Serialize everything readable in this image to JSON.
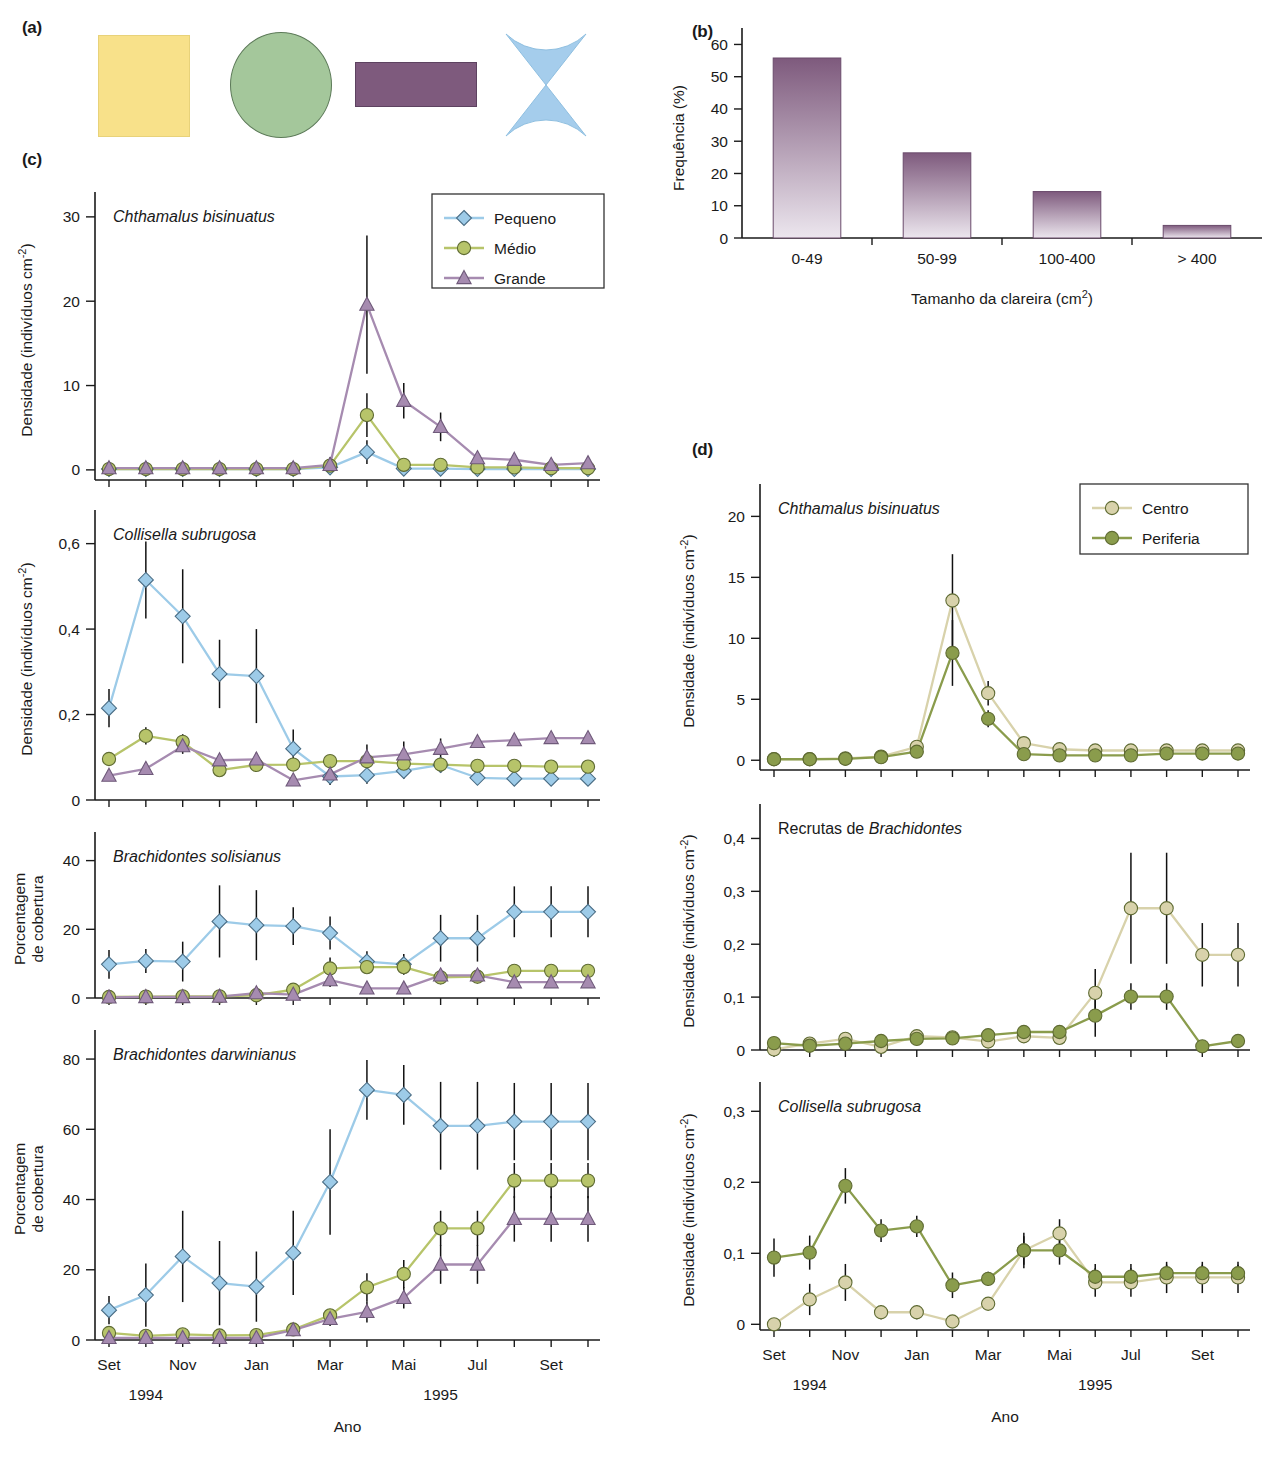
{
  "figure": {
    "panel_labels": {
      "a": "(a)",
      "b": "(b)",
      "c": "(c)",
      "d": "(d)"
    },
    "colors": {
      "pequeno": "#9dcbe8",
      "medio": "#b7c46a",
      "grande": "#a68bb0",
      "centro": "#d8d2ab",
      "periferia": "#7f9440",
      "bar_top": "#7e5a7d",
      "bar_bottom": "#ece6ee",
      "shape_yellow": "#f8e18a",
      "shape_green": "#a4c79b",
      "shape_purple": "#7e5a7d",
      "shape_blue": "#a5cdec"
    }
  },
  "panel_a": {
    "shapes": [
      {
        "name": "square",
        "color": "#f8e18a"
      },
      {
        "name": "circle",
        "color": "#a4c79b"
      },
      {
        "name": "rectangle",
        "color": "#7e5a7d"
      },
      {
        "name": "bowtie",
        "color": "#a5cdec"
      }
    ]
  },
  "chart_data": [
    {
      "id": "panel_b",
      "type": "bar",
      "title": "",
      "xlabel": "Tamanho da clareira (cm2)",
      "xlabel_sup": "2",
      "xlabel_base": "Tamanho da clareira (cm",
      "ylabel": "Frequência (%)",
      "categories": [
        "0-49",
        "50-99",
        "100-400",
        "> 400"
      ],
      "values": [
        55.8,
        26.4,
        14.4,
        3.9
      ],
      "yticks": [
        0,
        10,
        20,
        30,
        40,
        50,
        60
      ],
      "ylim": [
        0,
        62
      ],
      "grid": false
    },
    {
      "id": "panel_c_1",
      "type": "line",
      "title": "Chthamalus bisinuatus",
      "title_italic": true,
      "ylabel": "Densidade (indivíduos cm",
      "ylabel_sup": "-2",
      "ylabel_tail": ")",
      "yticks": [
        0,
        10,
        20,
        30
      ],
      "ylim": [
        -1.2,
        32
      ],
      "x": [
        "Set",
        "",
        "Nov",
        "",
        "Jan",
        "",
        "Mar",
        "",
        "Mai",
        "",
        "Jul",
        "",
        "Set",
        ""
      ],
      "legend": {
        "position": "top-right",
        "entries": [
          "Pequeno",
          "Médio",
          "Grande"
        ]
      },
      "series": [
        {
          "name": "Pequeno",
          "marker": "diamond",
          "color": "#9dcbe8",
          "values": [
            0.1,
            0.1,
            0.1,
            0.1,
            0.1,
            0.1,
            0.3,
            2.1,
            0.15,
            0.15,
            0.1,
            0.1,
            0.1,
            0.1
          ],
          "err": [
            0,
            0,
            0,
            0,
            0,
            0,
            0,
            1.4,
            0,
            0,
            0,
            0,
            0,
            0
          ]
        },
        {
          "name": "Médio",
          "marker": "circle",
          "color": "#b7c46a",
          "values": [
            0.1,
            0.1,
            0.1,
            0.1,
            0.1,
            0.1,
            0.5,
            6.5,
            0.6,
            0.6,
            0.3,
            0.3,
            0.2,
            0.2
          ],
          "err": [
            0,
            0,
            0,
            0,
            0,
            0,
            0,
            2.6,
            0.3,
            0.3,
            0,
            0,
            0,
            0
          ]
        },
        {
          "name": "Grande",
          "marker": "triangle",
          "color": "#a68bb0",
          "values": [
            0.2,
            0.2,
            0.2,
            0.2,
            0.2,
            0.2,
            0.6,
            19.6,
            8.2,
            5.1,
            1.4,
            1.2,
            0.6,
            0.8
          ],
          "err": [
            0,
            0,
            0,
            0,
            0,
            0,
            0.9,
            8.2,
            2.1,
            1.7,
            0,
            0,
            0,
            0.8
          ]
        }
      ]
    },
    {
      "id": "panel_c_2",
      "type": "line",
      "title": "Collisella subrugosa",
      "title_italic": true,
      "ylabel": "Densidade (indivíduos cm",
      "ylabel_sup": "-2",
      "ylabel_tail": ")",
      "yticks": [
        0,
        0.2,
        0.4,
        0.6
      ],
      "ytick_labels": [
        "0",
        "0,2",
        "0,4",
        "0,6"
      ],
      "ylim": [
        0,
        0.66
      ],
      "x": [
        "Set",
        "",
        "Nov",
        "",
        "Jan",
        "",
        "Mar",
        "",
        "Mai",
        "",
        "Jul",
        "",
        "Set",
        ""
      ],
      "series": [
        {
          "name": "Pequeno",
          "marker": "diamond",
          "color": "#9dcbe8",
          "values": [
            0.215,
            0.515,
            0.43,
            0.295,
            0.29,
            0.12,
            0.055,
            0.058,
            0.068,
            0.082,
            0.052,
            0.05,
            0.05,
            0.05
          ],
          "err": [
            0.045,
            0.09,
            0.11,
            0.08,
            0.11,
            0.045,
            0.02,
            0.02,
            0.018,
            0.018,
            0,
            0,
            0,
            0
          ]
        },
        {
          "name": "Médio",
          "marker": "circle",
          "color": "#b7c46a",
          "values": [
            0.096,
            0.15,
            0.136,
            0.07,
            0.082,
            0.083,
            0.091,
            0.091,
            0.085,
            0.083,
            0.08,
            0.08,
            0.078,
            0.078
          ],
          "err": [
            0,
            0.02,
            0.018,
            0.012,
            0.012,
            0.012,
            0.01,
            0.01,
            0.01,
            0.01,
            0,
            0,
            0,
            0
          ]
        },
        {
          "name": "Grande",
          "marker": "triangle",
          "color": "#a68bb0",
          "values": [
            0.057,
            0.073,
            0.126,
            0.093,
            0.095,
            0.046,
            0.06,
            0.1,
            0.107,
            0.12,
            0.136,
            0.14,
            0.145,
            0.145
          ],
          "err": [
            0,
            0,
            0.018,
            0.012,
            0.016,
            0.012,
            0.012,
            0.03,
            0.03,
            0.024,
            0.012,
            0,
            0.012,
            0.012
          ]
        }
      ]
    },
    {
      "id": "panel_c_3",
      "type": "line",
      "title": "Brachidontes solisianus",
      "title_italic": true,
      "ylabel": "Porcentagem de cobertura",
      "ylabel_line1": "Porcentagem",
      "ylabel_line2": "de cobertura",
      "yticks": [
        0,
        20,
        40
      ],
      "ylim": [
        0,
        46
      ],
      "x": [
        "Set",
        "",
        "Nov",
        "",
        "Jan",
        "",
        "Mar",
        "",
        "Mai",
        "",
        "Jul",
        "",
        "Set",
        ""
      ],
      "series": [
        {
          "name": "Pequeno",
          "marker": "diamond",
          "color": "#9dcbe8",
          "values": [
            9.8,
            10.8,
            10.6,
            22.3,
            21.2,
            20.9,
            18.9,
            10.6,
            9.8,
            17.4,
            17.4,
            25.1,
            25.1,
            25.1
          ],
          "err": [
            4.2,
            3.5,
            5.8,
            10.5,
            10.2,
            5.5,
            4.8,
            3.0,
            3.0,
            6.8,
            6.8,
            7.4,
            7.4,
            7.4
          ]
        },
        {
          "name": "Médio",
          "marker": "circle",
          "color": "#b7c46a",
          "values": [
            0.3,
            0.4,
            0.5,
            0.5,
            0.8,
            2.4,
            8.6,
            9.0,
            9.0,
            6.0,
            6.2,
            7.9,
            7.9,
            7.9
          ],
          "err": [
            0,
            0,
            0,
            0,
            0.6,
            1.2,
            3.2,
            1.2,
            1.2,
            2.0,
            2.0,
            0,
            0,
            0
          ]
        },
        {
          "name": "Grande",
          "marker": "triangle",
          "color": "#a68bb0",
          "values": [
            0.2,
            0.3,
            0.3,
            0.4,
            1.4,
            1.0,
            5.2,
            2.8,
            2.8,
            6.6,
            6.6,
            4.6,
            4.6,
            4.6
          ],
          "err": [
            0,
            0,
            0,
            0,
            0.8,
            0.8,
            2.0,
            0,
            0,
            0,
            0,
            0,
            0,
            0
          ]
        }
      ]
    },
    {
      "id": "panel_c_4",
      "type": "line",
      "title": "Brachidontes darwinianus",
      "title_italic": true,
      "ylabel": "Porcentagem de cobertura",
      "ylabel_line1": "Porcentagem",
      "ylabel_line2": "de cobertura",
      "yticks": [
        0,
        20,
        40,
        60,
        80
      ],
      "ylim": [
        0,
        86
      ],
      "x": [
        "Set",
        "",
        "Nov",
        "",
        "Jan",
        "",
        "Mar",
        "",
        "Mai",
        "",
        "Jul",
        "",
        "Set",
        ""
      ],
      "series": [
        {
          "name": "Pequeno",
          "marker": "diamond",
          "color": "#9dcbe8",
          "values": [
            8.5,
            12.8,
            23.8,
            16.2,
            15.2,
            24.8,
            45.0,
            71.2,
            69.8,
            61.0,
            61.0,
            62.2,
            62.2,
            62.2
          ],
          "err": [
            4.0,
            9.0,
            13.0,
            12.0,
            10.0,
            12.0,
            15.0,
            8.5,
            8.5,
            12.5,
            12.5,
            11.0,
            11.0,
            11.0
          ]
        },
        {
          "name": "Médio",
          "marker": "circle",
          "color": "#b7c46a",
          "values": [
            2.0,
            1.2,
            1.6,
            1.3,
            1.4,
            3.0,
            7.0,
            15.0,
            18.8,
            31.8,
            31.8,
            45.4,
            45.4,
            45.4
          ],
          "err": [
            0,
            0,
            0,
            0,
            0,
            0,
            0,
            4.0,
            4.0,
            5.0,
            5.0,
            5.0,
            5.0,
            5.0
          ]
        },
        {
          "name": "Grande",
          "marker": "triangle",
          "color": "#a68bb0",
          "values": [
            0.6,
            0.6,
            0.6,
            0.6,
            0.6,
            2.8,
            6.0,
            8.0,
            12.0,
            21.5,
            21.5,
            34.5,
            34.5,
            34.5
          ],
          "err": [
            0,
            0,
            0,
            0,
            0,
            0,
            2.0,
            3.0,
            3.0,
            5.5,
            5.5,
            6.5,
            6.5,
            6.5
          ]
        }
      ],
      "xlabel_months": [
        "Set",
        "Nov",
        "Jan",
        "Mar",
        "Mai",
        "Jul",
        "Set"
      ],
      "xlabel_years": [
        "1994",
        "1995"
      ],
      "xlabel": "Ano"
    },
    {
      "id": "panel_d_1",
      "type": "line",
      "title": "Chthamalus bisinuatus",
      "title_italic": true,
      "ylabel": "Densidade (indivíduos cm",
      "ylabel_sup": "-2",
      "ylabel_tail": ")",
      "yticks": [
        0,
        5,
        10,
        15,
        20
      ],
      "ylim": [
        -0.8,
        22
      ],
      "x": [
        "Set",
        "",
        "Nov",
        "",
        "Jan",
        "",
        "Mar",
        "",
        "Mai",
        "",
        "Jul",
        "",
        "Set",
        ""
      ],
      "legend": {
        "position": "top-right",
        "entries": [
          "Centro",
          "Periferia"
        ]
      },
      "series": [
        {
          "name": "Centro",
          "marker": "circle",
          "color": "#d8d2ab",
          "values": [
            0.1,
            0.1,
            0.15,
            0.3,
            1.1,
            13.1,
            5.5,
            1.4,
            0.9,
            0.8,
            0.8,
            0.8,
            0.8,
            0.8
          ],
          "err": [
            0,
            0,
            0,
            0,
            0,
            3.8,
            1.0,
            0,
            0,
            0,
            0,
            0,
            0,
            0
          ]
        },
        {
          "name": "Periferia",
          "marker": "circle",
          "color": "#8a9c4c",
          "values": [
            0.08,
            0.08,
            0.12,
            0.25,
            0.7,
            8.8,
            3.4,
            0.5,
            0.4,
            0.4,
            0.4,
            0.55,
            0.55,
            0.55
          ],
          "err": [
            0,
            0,
            0,
            0,
            0,
            2.7,
            0.7,
            0,
            0,
            0,
            0,
            0,
            0,
            0
          ]
        }
      ]
    },
    {
      "id": "panel_d_2",
      "type": "line",
      "title_plain": "Recrutas de ",
      "title_italic_part": "Brachidontes",
      "ylabel": "Densidade (indivíduos cm",
      "ylabel_sup": "-2",
      "ylabel_tail": ")",
      "yticks": [
        0,
        0.1,
        0.2,
        0.3,
        0.4
      ],
      "ytick_labels": [
        "0",
        "0,1",
        "0,2",
        "0,3",
        "0,4"
      ],
      "ylim": [
        0,
        0.45
      ],
      "x": [
        "Set",
        "",
        "Nov",
        "",
        "Jan",
        "",
        "Mar",
        "",
        "Mai",
        "",
        "Jul",
        "",
        "Set",
        ""
      ],
      "series": [
        {
          "name": "Centro",
          "marker": "circle",
          "color": "#d8d2ab",
          "values": [
            0.001,
            0.012,
            0.021,
            0.006,
            0.026,
            0.024,
            0.016,
            0.026,
            0.023,
            0.108,
            0.268,
            0.268,
            0.18,
            0.18
          ],
          "err": [
            0,
            0,
            0,
            0,
            0,
            0,
            0,
            0,
            0,
            0.045,
            0.105,
            0.105,
            0.06,
            0.06
          ]
        },
        {
          "name": "Periferia",
          "marker": "circle",
          "color": "#8a9c4c",
          "values": [
            0.013,
            0.008,
            0.012,
            0.017,
            0.021,
            0.022,
            0.028,
            0.034,
            0.034,
            0.065,
            0.101,
            0.101,
            0.007,
            0.017
          ],
          "err": [
            0,
            0,
            0,
            0,
            0,
            0,
            0,
            0,
            0,
            0.04,
            0.025,
            0.025,
            0,
            0
          ]
        }
      ]
    },
    {
      "id": "panel_d_3",
      "type": "line",
      "title": "Collisella subrugosa",
      "title_italic": true,
      "ylabel": "Densidade (indivíduos cm",
      "ylabel_sup": "-2",
      "ylabel_tail": ")",
      "yticks": [
        0,
        0.1,
        0.2,
        0.3
      ],
      "ytick_labels": [
        "0",
        "0,1",
        "0,2",
        "0,3"
      ],
      "ylim": [
        -0.008,
        0.33
      ],
      "x": [
        "Set",
        "",
        "Nov",
        "",
        "Jan",
        "",
        "Mar",
        "",
        "Mai",
        "",
        "Jul",
        "",
        "Set",
        ""
      ],
      "series": [
        {
          "name": "Centro",
          "marker": "circle",
          "color": "#d8d2ab",
          "values": [
            0.0,
            0.035,
            0.059,
            0.017,
            0.017,
            0.004,
            0.029,
            0.104,
            0.128,
            0.059,
            0.059,
            0.066,
            0.066,
            0.066
          ],
          "err": [
            0,
            0.022,
            0.026,
            0.01,
            0.01,
            0.008,
            0,
            0.025,
            0.02,
            0.02,
            0.02,
            0.022,
            0.022,
            0.022
          ]
        },
        {
          "name": "Periferia",
          "marker": "circle",
          "color": "#8a9c4c",
          "values": [
            0.094,
            0.101,
            0.195,
            0.132,
            0.138,
            0.055,
            0.064,
            0.104,
            0.104,
            0.067,
            0.067,
            0.072,
            0.072,
            0.072
          ],
          "err": [
            0.027,
            0.024,
            0.025,
            0.016,
            0.015,
            0.018,
            0.01,
            0.02,
            0.02,
            0.018,
            0.018,
            0.012,
            0.012,
            0.012
          ]
        }
      ],
      "xlabel_months": [
        "Set",
        "Nov",
        "Jan",
        "Mar",
        "Mai",
        "Jul",
        "Set"
      ],
      "xlabel_years": [
        "1994",
        "1995"
      ],
      "xlabel": "Ano"
    }
  ],
  "axis_labels": {
    "months": [
      "Set",
      "Nov",
      "Jan",
      "Mar",
      "Mai",
      "Jul",
      "Set"
    ],
    "years": [
      "1994",
      "1995"
    ],
    "ano": "Ano"
  }
}
